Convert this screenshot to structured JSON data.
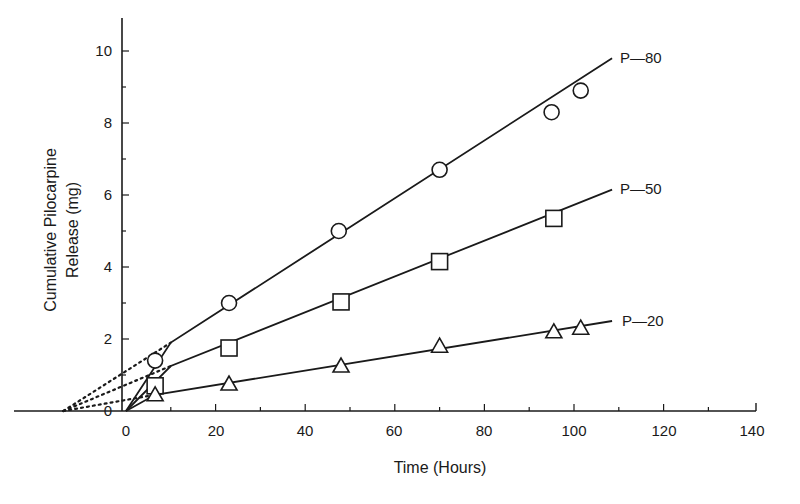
{
  "chart_data": {
    "type": "line",
    "title": "",
    "xlabel": "Time (Hours)",
    "ylabel": "Cumulative Pilocarpine Release (mg)",
    "ylabel_lines": [
      "Cumulative Pilocarpine",
      "Release (mg)"
    ],
    "xlim": [
      -16,
      140
    ],
    "ylim": [
      0,
      10.8
    ],
    "x_ticks": [
      0,
      20,
      40,
      60,
      80,
      100,
      120,
      140
    ],
    "y_ticks": [
      0,
      2,
      4,
      6,
      8,
      10
    ],
    "grid": false,
    "legend_position": "inline-right",
    "series": [
      {
        "name": "P—80",
        "marker": "circle",
        "points": [
          [
            6.5,
            1.4
          ],
          [
            23,
            3.0
          ],
          [
            47.5,
            5.0
          ],
          [
            70,
            6.7
          ],
          [
            95,
            8.3
          ],
          [
            101.5,
            8.9
          ]
        ],
        "fit_line": [
          [
            0,
            0
          ],
          [
            10,
            1.9
          ],
          [
            108.5,
            9.8
          ]
        ],
        "extrapolation": [
          [
            -14,
            0
          ],
          [
            10,
            1.9
          ]
        ]
      },
      {
        "name": "P—50",
        "marker": "square",
        "points": [
          [
            6.5,
            0.7
          ],
          [
            23,
            1.75
          ],
          [
            48,
            3.03
          ],
          [
            70,
            4.15
          ],
          [
            95.5,
            5.35
          ]
        ],
        "fit_line": [
          [
            0,
            0
          ],
          [
            10,
            1.25
          ],
          [
            108.5,
            6.15
          ]
        ],
        "extrapolation": [
          [
            -14,
            0
          ],
          [
            10,
            1.25
          ]
        ]
      },
      {
        "name": "P—20",
        "marker": "triangle",
        "points": [
          [
            6.5,
            0.45
          ],
          [
            23,
            0.75
          ],
          [
            48,
            1.25
          ],
          [
            70,
            1.8
          ],
          [
            95.5,
            2.2
          ],
          [
            101.5,
            2.3
          ]
        ],
        "fit_line": [
          [
            0,
            0
          ],
          [
            6.5,
            0.45
          ],
          [
            108.5,
            2.5
          ]
        ],
        "extrapolation": [
          [
            -14,
            0
          ],
          [
            6.5,
            0.45
          ]
        ]
      }
    ]
  },
  "axes": {
    "x_title": "Time (Hours)",
    "y_title_line1": "Cumulative Pilocarpine",
    "y_title_line2": "Release (mg)",
    "x_tick_labels": [
      "0",
      "20",
      "40",
      "60",
      "80",
      "100",
      "120",
      "140"
    ],
    "y_tick_labels": [
      "0",
      "2",
      "4",
      "6",
      "8",
      "10"
    ]
  },
  "labels": {
    "p80": "P—80",
    "p50": "P—50",
    "p20": "P—20"
  },
  "colors": {
    "ink": "#1a1a1a",
    "background": "#ffffff"
  }
}
